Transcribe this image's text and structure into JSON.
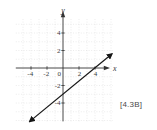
{
  "figure": {
    "tag_label": "[4.3B]"
  },
  "chart_data": {
    "type": "line",
    "title": "",
    "xlabel": "x",
    "ylabel": "y",
    "xlim": [
      -5.9,
      6.2
    ],
    "ylim": [
      -6.1,
      5.6
    ],
    "grid": true,
    "grid_step": 1,
    "x_tick_labels": [
      "-4",
      "-2",
      "0",
      "2",
      "4"
    ],
    "x_tick_values": [
      -4,
      -2,
      0,
      2,
      4
    ],
    "y_tick_labels": [
      "4",
      "2",
      "-2",
      "-4"
    ],
    "y_tick_values": [
      4,
      2,
      -2,
      -4
    ],
    "series": [
      {
        "name": "graph-line",
        "equation": "y = (3/4)x - 3",
        "slope": 0.75,
        "y_intercept": -3,
        "x_intercept": 4,
        "points": [
          [
            -4.15,
            -6.1
          ],
          [
            6.1,
            1.6
          ]
        ],
        "arrows_both_ends": true
      }
    ],
    "colors": {
      "axis": "#333333",
      "grid": "#d8d8d8",
      "line": "#161616",
      "label": "#3a3a3a"
    }
  }
}
